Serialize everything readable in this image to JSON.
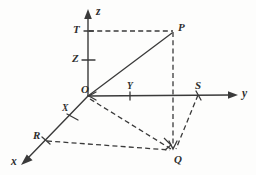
{
  "figure": {
    "background_color": "#fdfdfc",
    "ink_color": "#3a3a3a",
    "axes": [
      {
        "id": "x",
        "label": "x",
        "direction": "down-left",
        "arrow": true
      },
      {
        "id": "y",
        "label": "y",
        "direction": "right",
        "arrow": true
      },
      {
        "id": "z",
        "label": "z",
        "direction": "up",
        "arrow": true
      }
    ],
    "labels": {
      "origin": "O",
      "x_axis_tip": "x",
      "y_axis_tip": "y",
      "z_axis_tip": "z",
      "z_upper": "T",
      "z_lower": "Z",
      "x_mark": "X",
      "y_mark": "Y",
      "point_p": "P",
      "point_q": "Q",
      "point_r": "R",
      "point_s": "S"
    },
    "points": {
      "O": {
        "x": 88,
        "y": 96,
        "label": "O"
      },
      "P": {
        "x": 173,
        "y": 31,
        "label": "P"
      },
      "Q": {
        "x": 173,
        "y": 150,
        "label": "Q"
      },
      "R": {
        "x": 45,
        "y": 140,
        "label": "R"
      },
      "S": {
        "x": 199,
        "y": 92,
        "label": "S"
      },
      "T": {
        "x": 88,
        "y": 31,
        "label": "T"
      },
      "Z": {
        "x": 88,
        "y": 60,
        "label": "Z"
      },
      "X": {
        "x": 72,
        "y": 113,
        "label": "X"
      },
      "Y": {
        "x": 130,
        "y": 96,
        "label": "Y"
      }
    },
    "segments": [
      {
        "name": "OP",
        "from": "O",
        "to": "P",
        "style": "solid"
      },
      {
        "name": "TP",
        "from": "T",
        "to": "P",
        "style": "dashed"
      },
      {
        "name": "PQ",
        "from": "P",
        "to": "Q",
        "style": "dashed"
      },
      {
        "name": "OQ",
        "from": "O",
        "to": "Q",
        "style": "dashed"
      },
      {
        "name": "RQ",
        "from": "R",
        "to": "Q",
        "style": "dashed"
      },
      {
        "name": "SQ",
        "from": "S",
        "to": "Q",
        "style": "dashed"
      },
      {
        "name": "OR",
        "from": "O",
        "to": "R",
        "style": "solid-axis"
      },
      {
        "name": "OS",
        "from": "O",
        "to": "S",
        "style": "solid-axis"
      }
    ],
    "markers": {
      "right_angle_at": "Q",
      "ticks": [
        "Z",
        "X",
        "Y"
      ]
    }
  }
}
